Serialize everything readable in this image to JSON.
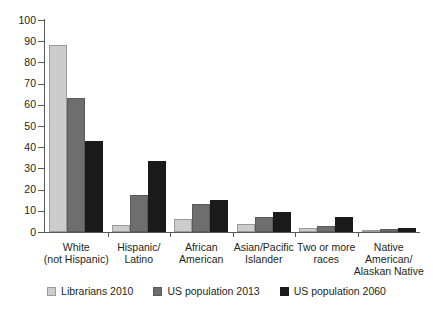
{
  "chart_data": {
    "type": "bar",
    "title": "",
    "subtitle": "",
    "xlabel": "",
    "ylabel": "",
    "ylim": [
      0,
      100
    ],
    "yticks": [
      0,
      10,
      20,
      30,
      40,
      50,
      60,
      70,
      80,
      90,
      100
    ],
    "ytick_labels": [
      "0",
      "10",
      "20",
      "30",
      "40",
      "50",
      "60",
      "70",
      "80",
      "90",
      "100"
    ],
    "grid": false,
    "legend_position": "bottom",
    "categories": [
      "White\n(not Hispanic)",
      "Hispanic/\nLatino",
      "African\nAmerican",
      "Asian/Pacific\nIslander",
      "Two or more\nraces",
      "Native\nAmerican/\nAlaskan Native"
    ],
    "series": [
      {
        "name": "Librarians 2010",
        "color": "#cccccc",
        "values": [
          88,
          3.5,
          6,
          4,
          2,
          1
        ]
      },
      {
        "name": "US population 2013",
        "color": "#6e6e6e",
        "values": [
          63,
          17.5,
          13,
          7,
          3,
          1.5
        ]
      },
      {
        "name": "US population 2060",
        "color": "#1a1a1a",
        "values": [
          43,
          33.5,
          15,
          9.5,
          7,
          2
        ]
      }
    ]
  },
  "legend": {
    "items": [
      {
        "label": "Librarians 2010"
      },
      {
        "label": "US population 2013"
      },
      {
        "label": "US population 2060"
      }
    ]
  }
}
